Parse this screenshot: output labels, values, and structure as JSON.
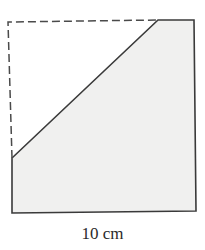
{
  "figure": {
    "side_label": "10 cm",
    "colors": {
      "fill": "#f0f0ef",
      "stroke": "#3a3a3a",
      "dashed": "#4a4a4a",
      "background": "#ffffff"
    },
    "outline_points": "12,158 158,20 194,20 196,211 12,213",
    "dashed_points": "12,158 8,22 158,20"
  }
}
